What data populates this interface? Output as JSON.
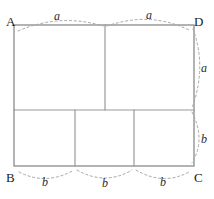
{
  "figure": {
    "background_color": "#ffffff",
    "line_color": "#8a8a8a",
    "arc_color": "#a8a8a8",
    "label_color": "#1a1a1a",
    "width": 214,
    "height": 199
  },
  "vertices": {
    "a_label": "A",
    "b_label": "B",
    "c_label": "C",
    "d_label": "D"
  },
  "measures": {
    "top_left": "a",
    "top_right": "a",
    "right_upper": "a",
    "right_lower": "b",
    "bottom_left": "b",
    "bottom_middle": "b",
    "bottom_right": "b"
  },
  "geometry": {
    "outer_rect": {
      "left": 14,
      "top": 25,
      "right": 194,
      "bottom": 166
    },
    "top_row_divider_x": 105,
    "middle_line_y": 110,
    "bottom_divider_1_x": 75,
    "bottom_divider_2_x": 134,
    "squares_count": 5
  }
}
